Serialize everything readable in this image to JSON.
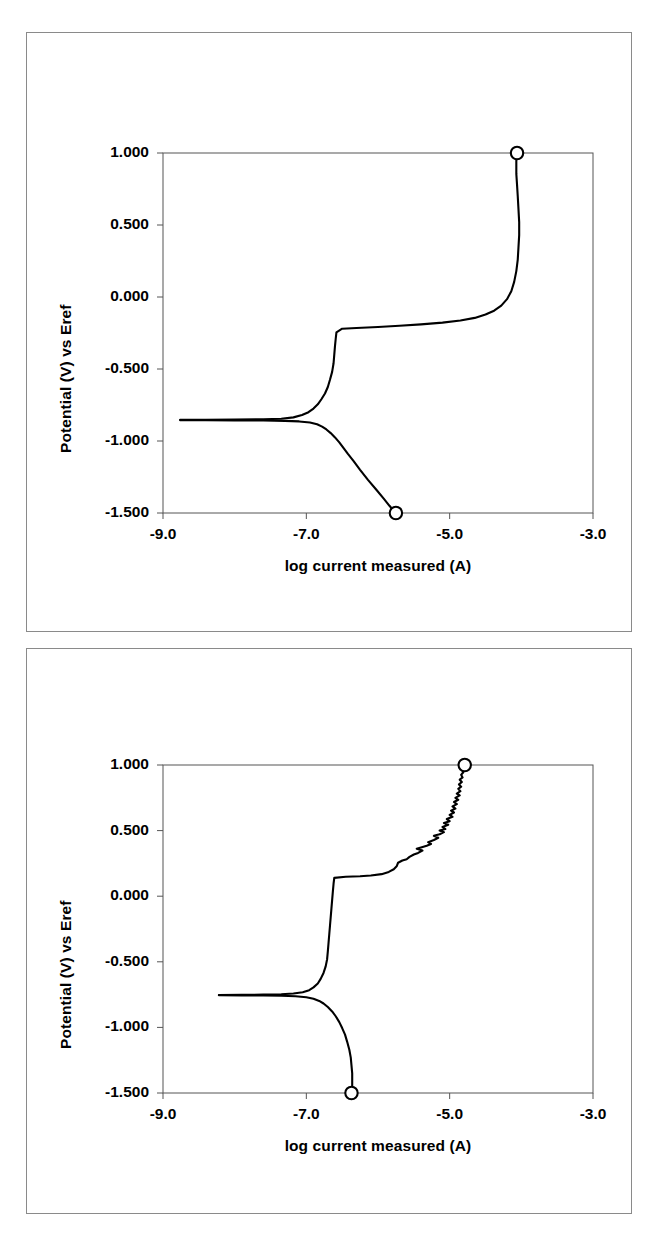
{
  "document": {
    "panel_count": 2,
    "background_color": "#ffffff",
    "frame_color": "#8a8a8a",
    "ink_color": "#000000"
  },
  "chart_data": [
    {
      "type": "line",
      "title": "",
      "xlabel": "log current measured (A)",
      "ylabel": "Potential (V) vs Eref",
      "xlim": [
        -9.0,
        -3.0
      ],
      "ylim": [
        -1.5,
        1.0
      ],
      "xticks": [
        -9.0,
        -7.0,
        -5.0,
        -3.0
      ],
      "xtick_labels": [
        "-9.0",
        "-7.0",
        "-5.0",
        "-3.0"
      ],
      "yticks": [
        1.0,
        0.5,
        0.0,
        -0.5,
        -1.0,
        -1.5
      ],
      "ytick_labels": [
        "1.000",
        "0.500",
        "0.000",
        "-0.500",
        "-1.000",
        "-1.500"
      ],
      "grid": false,
      "legend": "none",
      "series": [
        {
          "name": "cathodic-branch",
          "comment": "swept from open circuit downward to -1.500 V",
          "points": [
            [
              -8.76,
              -0.855
            ],
            [
              -8.4,
              -0.856
            ],
            [
              -8.0,
              -0.857
            ],
            [
              -7.6,
              -0.858
            ],
            [
              -7.3,
              -0.86
            ],
            [
              -7.1,
              -0.864
            ],
            [
              -6.95,
              -0.872
            ],
            [
              -6.85,
              -0.884
            ],
            [
              -6.78,
              -0.9
            ],
            [
              -6.72,
              -0.92
            ],
            [
              -6.66,
              -0.945
            ],
            [
              -6.6,
              -0.975
            ],
            [
              -6.54,
              -1.01
            ],
            [
              -6.48,
              -1.05
            ],
            [
              -6.42,
              -1.09
            ],
            [
              -6.34,
              -1.14
            ],
            [
              -6.25,
              -1.2
            ],
            [
              -6.14,
              -1.27
            ],
            [
              -6.02,
              -1.34
            ],
            [
              -5.92,
              -1.4
            ],
            [
              -5.84,
              -1.45
            ],
            [
              -5.78,
              -1.485
            ],
            [
              -5.75,
              -1.5
            ]
          ],
          "end_marker": {
            "x": -5.75,
            "y": -1.5,
            "shape": "open-circle"
          }
        },
        {
          "name": "anodic-branch",
          "comment": "swept from open circuit upward to +1.000 V, passive plateau then transpassive rise",
          "points": [
            [
              -8.76,
              -0.853
            ],
            [
              -8.4,
              -0.852
            ],
            [
              -8.0,
              -0.851
            ],
            [
              -7.6,
              -0.849
            ],
            [
              -7.35,
              -0.845
            ],
            [
              -7.18,
              -0.836
            ],
            [
              -7.06,
              -0.82
            ],
            [
              -6.97,
              -0.8
            ],
            [
              -6.9,
              -0.775
            ],
            [
              -6.84,
              -0.745
            ],
            [
              -6.79,
              -0.71
            ],
            [
              -6.74,
              -0.67
            ],
            [
              -6.7,
              -0.625
            ],
            [
              -6.67,
              -0.575
            ],
            [
              -6.64,
              -0.52
            ],
            [
              -6.62,
              -0.46
            ],
            [
              -6.61,
              -0.4
            ],
            [
              -6.6,
              -0.34
            ],
            [
              -6.59,
              -0.29
            ],
            [
              -6.58,
              -0.245
            ],
            [
              -6.5,
              -0.22
            ],
            [
              -6.3,
              -0.215
            ],
            [
              -6.0,
              -0.208
            ],
            [
              -5.7,
              -0.2
            ],
            [
              -5.4,
              -0.19
            ],
            [
              -5.1,
              -0.178
            ],
            [
              -4.85,
              -0.163
            ],
            [
              -4.65,
              -0.145
            ],
            [
              -4.5,
              -0.122
            ],
            [
              -4.38,
              -0.095
            ],
            [
              -4.28,
              -0.06
            ],
            [
              -4.2,
              -0.015
            ],
            [
              -4.14,
              0.04
            ],
            [
              -4.1,
              0.105
            ],
            [
              -4.07,
              0.18
            ],
            [
              -4.05,
              0.26
            ],
            [
              -4.04,
              0.345
            ],
            [
              -4.03,
              0.43
            ],
            [
              -4.03,
              0.52
            ],
            [
              -4.04,
              0.61
            ],
            [
              -4.05,
              0.7
            ],
            [
              -4.06,
              0.78
            ],
            [
              -4.07,
              0.855
            ],
            [
              -4.07,
              0.92
            ],
            [
              -4.07,
              0.965
            ],
            [
              -4.06,
              1.0
            ]
          ],
          "end_marker": {
            "x": -4.06,
            "y": 1.0,
            "shape": "open-circle"
          }
        }
      ]
    },
    {
      "type": "line",
      "title": "",
      "xlabel": "log current measured (A)",
      "ylabel": "Potential (V) vs Eref",
      "xlim": [
        -9.0,
        -3.0
      ],
      "ylim": [
        -1.5,
        1.0
      ],
      "xticks": [
        -9.0,
        -7.0,
        -5.0,
        -3.0
      ],
      "xtick_labels": [
        "-9.0",
        "-7.0",
        "-5.0",
        "-3.0"
      ],
      "yticks": [
        1.0,
        0.5,
        0.0,
        -0.5,
        -1.0,
        -1.5
      ],
      "ytick_labels": [
        "1.000",
        "0.500",
        "0.000",
        "-0.500",
        "-1.000",
        "-1.500"
      ],
      "grid": false,
      "legend": "none",
      "series": [
        {
          "name": "cathodic-branch",
          "comment": "swept from open circuit downward to -1.500 V",
          "points": [
            [
              -8.22,
              -0.755
            ],
            [
              -7.9,
              -0.756
            ],
            [
              -7.6,
              -0.757
            ],
            [
              -7.35,
              -0.759
            ],
            [
              -7.15,
              -0.763
            ],
            [
              -7.0,
              -0.77
            ],
            [
              -6.9,
              -0.782
            ],
            [
              -6.82,
              -0.798
            ],
            [
              -6.76,
              -0.818
            ],
            [
              -6.7,
              -0.845
            ],
            [
              -6.64,
              -0.878
            ],
            [
              -6.59,
              -0.915
            ],
            [
              -6.54,
              -0.96
            ],
            [
              -6.5,
              -1.005
            ],
            [
              -6.46,
              -1.055
            ],
            [
              -6.43,
              -1.11
            ],
            [
              -6.4,
              -1.17
            ],
            [
              -6.38,
              -1.23
            ],
            [
              -6.37,
              -1.29
            ],
            [
              -6.36,
              -1.35
            ],
            [
              -6.36,
              -1.41
            ],
            [
              -6.36,
              -1.46
            ],
            [
              -6.37,
              -1.5
            ]
          ],
          "end_marker": {
            "x": -6.37,
            "y": -1.5,
            "shape": "open-circle"
          }
        },
        {
          "name": "anodic-branch",
          "comment": "swept from open circuit upward to +1.000 V, pseudo-passive step then noisy transpassive rise",
          "points": [
            [
              -8.22,
              -0.753
            ],
            [
              -7.9,
              -0.752
            ],
            [
              -7.6,
              -0.75
            ],
            [
              -7.35,
              -0.747
            ],
            [
              -7.18,
              -0.742
            ],
            [
              -7.05,
              -0.732
            ],
            [
              -6.96,
              -0.716
            ],
            [
              -6.9,
              -0.695
            ],
            [
              -6.84,
              -0.665
            ],
            [
              -6.8,
              -0.63
            ],
            [
              -6.76,
              -0.585
            ],
            [
              -6.73,
              -0.535
            ],
            [
              -6.71,
              -0.48
            ],
            [
              -6.7,
              -0.42
            ],
            [
              -6.69,
              -0.355
            ],
            [
              -6.68,
              -0.29
            ],
            [
              -6.67,
              -0.225
            ],
            [
              -6.66,
              -0.16
            ],
            [
              -6.65,
              -0.095
            ],
            [
              -6.64,
              -0.03
            ],
            [
              -6.63,
              0.035
            ],
            [
              -6.62,
              0.095
            ],
            [
              -6.61,
              0.14
            ],
            [
              -6.45,
              0.148
            ],
            [
              -6.25,
              0.152
            ],
            [
              -6.1,
              0.158
            ],
            [
              -5.95,
              0.168
            ],
            [
              -5.85,
              0.185
            ],
            [
              -5.78,
              0.205
            ],
            [
              -5.74,
              0.228
            ],
            [
              -5.72,
              0.255
            ],
            [
              -5.66,
              0.272
            ],
            [
              -5.6,
              0.282
            ],
            [
              -5.56,
              0.3
            ],
            [
              -5.5,
              0.318
            ],
            [
              -5.44,
              0.33
            ],
            [
              -5.38,
              0.348
            ],
            [
              -5.46,
              0.362
            ],
            [
              -5.4,
              0.372
            ],
            [
              -5.32,
              0.385
            ],
            [
              -5.26,
              0.398
            ],
            [
              -5.3,
              0.412
            ],
            [
              -5.22,
              0.428
            ],
            [
              -5.16,
              0.445
            ],
            [
              -5.22,
              0.46
            ],
            [
              -5.14,
              0.472
            ],
            [
              -5.08,
              0.488
            ],
            [
              -5.14,
              0.5
            ],
            [
              -5.06,
              0.512
            ],
            [
              -5.1,
              0.528
            ],
            [
              -5.02,
              0.545
            ],
            [
              -5.08,
              0.558
            ],
            [
              -5.0,
              0.572
            ],
            [
              -5.04,
              0.588
            ],
            [
              -4.96,
              0.605
            ],
            [
              -5.0,
              0.62
            ],
            [
              -4.94,
              0.638
            ],
            [
              -4.98,
              0.652
            ],
            [
              -4.92,
              0.668
            ],
            [
              -4.96,
              0.685
            ],
            [
              -4.9,
              0.702
            ],
            [
              -4.94,
              0.718
            ],
            [
              -4.88,
              0.735
            ],
            [
              -4.92,
              0.75
            ],
            [
              -4.86,
              0.768
            ],
            [
              -4.9,
              0.782
            ],
            [
              -4.85,
              0.8
            ],
            [
              -4.88,
              0.818
            ],
            [
              -4.84,
              0.835
            ],
            [
              -4.87,
              0.852
            ],
            [
              -4.83,
              0.87
            ],
            [
              -4.86,
              0.888
            ],
            [
              -4.82,
              0.905
            ],
            [
              -4.84,
              0.925
            ],
            [
              -4.81,
              0.945
            ],
            [
              -4.83,
              0.965
            ],
            [
              -4.8,
              0.985
            ],
            [
              -4.79,
              1.0
            ]
          ],
          "end_marker": {
            "x": -4.79,
            "y": 1.0,
            "shape": "open-circle"
          }
        }
      ]
    }
  ]
}
